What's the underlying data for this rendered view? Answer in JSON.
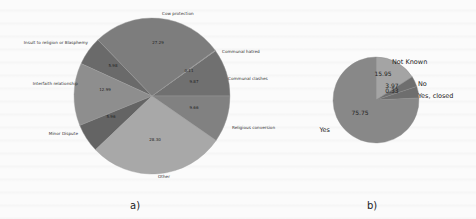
{
  "chart_data": [
    {
      "type": "pie",
      "panel": "a)",
      "title": "",
      "categories": [
        "Communal clashes",
        "Communal hatred",
        "Cow protection",
        "Insult to religion or Blasphemy",
        "Interfaith relationship",
        "Minor Dispute",
        "Other",
        "Religious conversion"
      ],
      "values": [
        9.87,
        0.11,
        27.29,
        5.98,
        12.99,
        5.96,
        28.3,
        9.66
      ],
      "value_labels": [
        "9.87",
        "0.11",
        "27.29",
        "5.98",
        "12.99",
        "5.96",
        "28.30",
        "9.66"
      ],
      "colors": [
        "#707070",
        "#9a9a9a",
        "#7d7d7d",
        "#6a6a6a",
        "#8e8e8e",
        "#646464",
        "#a8a8a8",
        "#818181"
      ]
    },
    {
      "type": "pie",
      "panel": "b)",
      "title": "",
      "categories": [
        "Not Known",
        "No",
        "Yes, closed",
        "Yes"
      ],
      "values": [
        15.95,
        3.97,
        4.33,
        75.75
      ],
      "value_labels": [
        "15.95",
        "3.97",
        "0.33",
        "75.75"
      ],
      "colors": [
        "#a4a4a4",
        "#6e6e6e",
        "#6e6e6e",
        "#888888"
      ]
    }
  ],
  "captions": {
    "a": "a)",
    "b": "b)"
  }
}
